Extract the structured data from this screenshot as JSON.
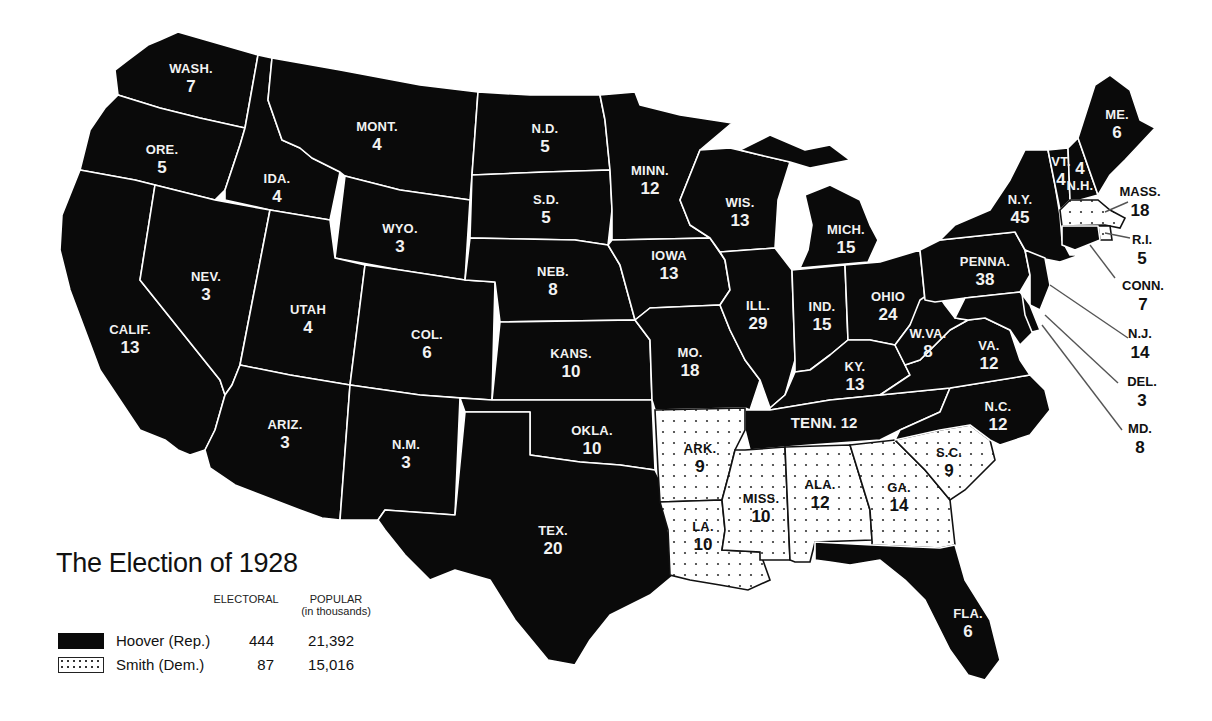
{
  "title": "The Election of 1928",
  "legend": {
    "header_electoral": "ELECTORAL",
    "header_popular": "POPULAR",
    "header_popular_sub": "(in thousands)",
    "candidates": [
      {
        "name": "Hoover (Rep.)",
        "party": "Republican",
        "pattern": "solid-black",
        "electoral": "444",
        "popular": "21,392"
      },
      {
        "name": "Smith (Dem.)",
        "party": "Democratic",
        "pattern": "dotted",
        "electoral": "87",
        "popular": "15,016"
      }
    ]
  },
  "colors": {
    "republican": "#0a0a0a",
    "democratic_fill": "#ffffff",
    "dot": "#333333",
    "border": "#ffffff",
    "background": "#ffffff"
  },
  "states": {
    "wash": {
      "abbr": "WASH.",
      "ev": "7",
      "winner": "Hoover"
    },
    "ore": {
      "abbr": "ORE.",
      "ev": "5",
      "winner": "Hoover"
    },
    "calif": {
      "abbr": "CALIF.",
      "ev": "13",
      "winner": "Hoover"
    },
    "ida": {
      "abbr": "IDA.",
      "ev": "4",
      "winner": "Hoover"
    },
    "nev": {
      "abbr": "NEV.",
      "ev": "3",
      "winner": "Hoover"
    },
    "mont": {
      "abbr": "MONT.",
      "ev": "4",
      "winner": "Hoover"
    },
    "wyo": {
      "abbr": "WYO.",
      "ev": "3",
      "winner": "Hoover"
    },
    "utah": {
      "abbr": "UTAH",
      "ev": "4",
      "winner": "Hoover"
    },
    "col": {
      "abbr": "COL.",
      "ev": "6",
      "winner": "Hoover"
    },
    "ariz": {
      "abbr": "ARIZ.",
      "ev": "3",
      "winner": "Hoover"
    },
    "nm": {
      "abbr": "N.M.",
      "ev": "3",
      "winner": "Hoover"
    },
    "nd": {
      "abbr": "N.D.",
      "ev": "5",
      "winner": "Hoover"
    },
    "sd": {
      "abbr": "S.D.",
      "ev": "5",
      "winner": "Hoover"
    },
    "neb": {
      "abbr": "NEB.",
      "ev": "8",
      "winner": "Hoover"
    },
    "kans": {
      "abbr": "KANS.",
      "ev": "10",
      "winner": "Hoover"
    },
    "okla": {
      "abbr": "OKLA.",
      "ev": "10",
      "winner": "Hoover"
    },
    "tex": {
      "abbr": "TEX.",
      "ev": "20",
      "winner": "Hoover"
    },
    "minn": {
      "abbr": "MINN.",
      "ev": "12",
      "winner": "Hoover"
    },
    "iowa": {
      "abbr": "IOWA",
      "ev": "13",
      "winner": "Hoover"
    },
    "mo": {
      "abbr": "MO.",
      "ev": "18",
      "winner": "Hoover"
    },
    "ark": {
      "abbr": "ARK.",
      "ev": "9",
      "winner": "Smith"
    },
    "la": {
      "abbr": "LA.",
      "ev": "10",
      "winner": "Smith"
    },
    "wis": {
      "abbr": "WIS.",
      "ev": "13",
      "winner": "Hoover"
    },
    "ill": {
      "abbr": "ILL.",
      "ev": "29",
      "winner": "Hoover"
    },
    "mich": {
      "abbr": "MICH.",
      "ev": "15",
      "winner": "Hoover"
    },
    "ind": {
      "abbr": "IND.",
      "ev": "15",
      "winner": "Hoover"
    },
    "ohio": {
      "abbr": "OHIO",
      "ev": "24",
      "winner": "Hoover"
    },
    "ky": {
      "abbr": "KY.",
      "ev": "13",
      "winner": "Hoover"
    },
    "tenn": {
      "abbr": "TENN.",
      "ev": "12",
      "winner": "Hoover"
    },
    "miss": {
      "abbr": "MISS.",
      "ev": "10",
      "winner": "Smith"
    },
    "ala": {
      "abbr": "ALA.",
      "ev": "12",
      "winner": "Smith"
    },
    "ga": {
      "abbr": "GA.",
      "ev": "14",
      "winner": "Smith"
    },
    "fla": {
      "abbr": "FLA.",
      "ev": "6",
      "winner": "Hoover"
    },
    "sc": {
      "abbr": "S.C.",
      "ev": "9",
      "winner": "Smith"
    },
    "nc": {
      "abbr": "N.C.",
      "ev": "12",
      "winner": "Hoover"
    },
    "va": {
      "abbr": "VA.",
      "ev": "12",
      "winner": "Hoover"
    },
    "wva": {
      "abbr": "W.VA.",
      "ev": "8",
      "winner": "Hoover"
    },
    "penna": {
      "abbr": "PENNA.",
      "ev": "38",
      "winner": "Hoover"
    },
    "ny": {
      "abbr": "N.Y.",
      "ev": "45",
      "winner": "Hoover"
    },
    "vt": {
      "abbr": "VT.",
      "ev": "4",
      "winner": "Hoover"
    },
    "nh": {
      "abbr": "N.H.",
      "ev": "4",
      "winner": "Hoover"
    },
    "me": {
      "abbr": "ME.",
      "ev": "6",
      "winner": "Hoover"
    },
    "mass": {
      "abbr": "MASS.",
      "ev": "18",
      "winner": "Smith"
    },
    "ri": {
      "abbr": "R.I.",
      "ev": "5",
      "winner": "Smith"
    },
    "conn": {
      "abbr": "CONN.",
      "ev": "7",
      "winner": "Hoover"
    },
    "nj": {
      "abbr": "N.J.",
      "ev": "14",
      "winner": "Hoover"
    },
    "del": {
      "abbr": "DEL.",
      "ev": "3",
      "winner": "Hoover"
    },
    "md": {
      "abbr": "MD.",
      "ev": "8",
      "winner": "Hoover"
    }
  }
}
